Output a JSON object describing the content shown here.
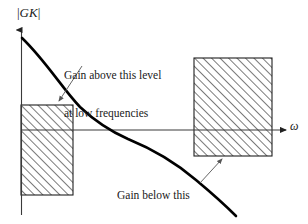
{
  "figure": {
    "axes": {
      "y_label": "|GK|",
      "y_label_bar_open": "|",
      "y_label_var": "GK",
      "y_label_bar_close": "|",
      "x_label": "ω"
    },
    "annotations": [
      {
        "id": "high-gain",
        "lines": [
          "Gain above this level",
          "at low frequencies"
        ],
        "line1": "Gain above this level",
        "line2": "at low frequencies"
      },
      {
        "id": "low-gain",
        "lines": [
          "Gain below this",
          "level at high",
          "frequencies"
        ],
        "line1": "Gain below this",
        "line2": "level at high",
        "line3": "frequencies"
      }
    ],
    "regions": [
      {
        "id": "low-frequency-constraint-box",
        "name": "low-frequency-performance-bound",
        "x": 21,
        "y": 105,
        "width": 52,
        "height": 90,
        "hatch": "forward-diagonal"
      },
      {
        "id": "high-frequency-constraint-box",
        "name": "high-frequency-robustness-bound",
        "x": 194,
        "y": 58,
        "width": 78,
        "height": 98,
        "hatch": "forward-diagonal"
      }
    ],
    "curve": {
      "name": "loop-gain-magnitude",
      "description": "monotonically decreasing open loop gain magnitude"
    },
    "colors": {
      "ink": "#000000",
      "hatch": "#2b2b2b",
      "axis": "#3a3a3a",
      "leader": "#555555",
      "background": "#ffffff"
    }
  }
}
